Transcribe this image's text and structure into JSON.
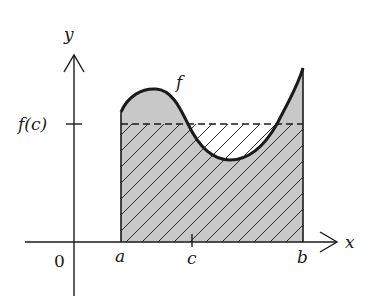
{
  "diagram": {
    "labels": {
      "y_axis": "y",
      "x_axis": "x",
      "origin": "0",
      "a": "a",
      "b": "b",
      "c": "c",
      "f_of_c": "f(c)",
      "function": "f"
    },
    "colors": {
      "curve": "#1a1a1a",
      "fill_under_curve": "#c8c8c8",
      "hatch": "#2a2a2a",
      "axis": "#1a1a1a",
      "background": "#ffffff"
    },
    "regions": [
      {
        "name": "area-under-f",
        "description": "gray shaded area under f between a and b"
      },
      {
        "name": "rectangle-f-c",
        "description": "hatched rectangle of height f(c) from a to b"
      }
    ]
  }
}
